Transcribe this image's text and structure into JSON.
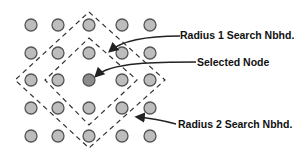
{
  "diagram": {
    "grid": {
      "cols_x": [
        31,
        58,
        89,
        122,
        150
      ],
      "rows_y": [
        25,
        53,
        80,
        108,
        136
      ],
      "node_radius": 6,
      "node_fill": "#bdbdbd",
      "node_stroke": "#555555",
      "selected": {
        "col": 2,
        "row": 2,
        "fill": "#8c8c8c"
      }
    },
    "neighborhoods": [
      {
        "name": "radius-1",
        "points": "89,38 137,80 89,125 45,80"
      },
      {
        "name": "radius-2",
        "points": "89,12 165,80 89,148 15,80"
      }
    ],
    "labels": {
      "radius1": "Radius 1 Search Nbhd.",
      "selected": "Selected Node",
      "radius2": "Radius 2 Search Nbhd."
    }
  }
}
